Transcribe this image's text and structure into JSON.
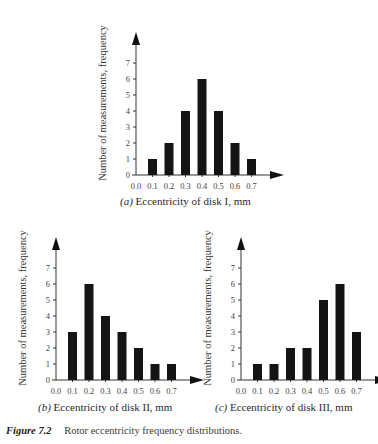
{
  "figure": {
    "number": "Figure 7.2",
    "caption": "Rotor eccentricity frequency distributions."
  },
  "chart_data": [
    {
      "type": "bar",
      "panel": "a",
      "panel_label": "(a)",
      "title": "Eccentricity of disk I, mm",
      "xlabel": "Eccentricity of disk I, mm",
      "ylabel": "Number of measurements, frequency",
      "x_ticks": [
        "0.0",
        "0.1",
        "0.2",
        "0.3",
        "0.4",
        "0.5",
        "0.6",
        "0.7"
      ],
      "y_ticks": [
        "0",
        "1",
        "2",
        "3",
        "4",
        "5",
        "6",
        "7"
      ],
      "categories": [
        "0.1",
        "0.2",
        "0.3",
        "0.4",
        "0.5",
        "0.6",
        "0.7"
      ],
      "values": [
        1,
        2,
        4,
        6,
        4,
        2,
        1
      ],
      "ylim": [
        0,
        7
      ],
      "grid": false
    },
    {
      "type": "bar",
      "panel": "b",
      "panel_label": "(b)",
      "title": "Eccentricity of disk II, mm",
      "xlabel": "Eccentricity of disk II, mm",
      "ylabel": "Number of measurements, frequency",
      "x_ticks": [
        "0.0",
        "0.1",
        "0.2",
        "0.3",
        "0.4",
        "0.5",
        "0.6",
        "0.7"
      ],
      "y_ticks": [
        "0",
        "1",
        "2",
        "3",
        "4",
        "5",
        "6",
        "7"
      ],
      "categories": [
        "0.1",
        "0.2",
        "0.3",
        "0.4",
        "0.5",
        "0.6",
        "0.7"
      ],
      "values": [
        3,
        6,
        4,
        3,
        2,
        1,
        1
      ],
      "ylim": [
        0,
        7
      ],
      "grid": false
    },
    {
      "type": "bar",
      "panel": "c",
      "panel_label": "(c)",
      "title": "Eccentricity of disk III, mm",
      "xlabel": "Eccentricity of disk III, mm",
      "ylabel": "Number of measurements, frequency",
      "x_ticks": [
        "0.0",
        "0.1",
        "0.2",
        "0.3",
        "0.4",
        "0.5",
        "0.6",
        "0.7"
      ],
      "y_ticks": [
        "0",
        "1",
        "2",
        "3",
        "4",
        "5",
        "6",
        "7"
      ],
      "categories": [
        "0.1",
        "0.2",
        "0.3",
        "0.4",
        "0.5",
        "0.6",
        "0.7"
      ],
      "values": [
        1,
        1,
        2,
        2,
        5,
        6,
        3
      ],
      "ylim": [
        0,
        7
      ],
      "grid": false
    }
  ],
  "colors": {
    "bar": "#141414",
    "axis": "#333333"
  }
}
